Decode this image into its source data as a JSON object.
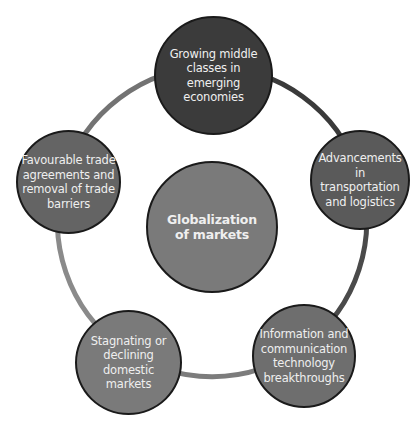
{
  "diagram": {
    "type": "cycle",
    "center": {
      "label": "Globalization of markets",
      "lines": [
        "Globalization",
        "of markets"
      ],
      "color": "#7a7a7a"
    },
    "nodes": [
      {
        "id": "growing-middle-classes",
        "lines": [
          "Growing middle",
          "classes in",
          "emerging",
          "economies"
        ],
        "label": "Growing middle classes in emerging economies",
        "color": "#3b3b3b"
      },
      {
        "id": "advancements-transportation",
        "lines": [
          "Advancements in",
          "transportation",
          "and logistics"
        ],
        "label": "Advancements in transportation and logistics",
        "color": "#5a5a5a"
      },
      {
        "id": "ict-breakthroughs",
        "lines": [
          "Information and",
          "communication",
          "technology",
          "breakthroughs"
        ],
        "label": "Information and communication technology breakthroughs",
        "color": "#6e6e6e"
      },
      {
        "id": "stagnating-domestic",
        "lines": [
          "Stagnating or",
          "declining",
          "domestic",
          "markets"
        ],
        "label": "Stagnating or declining domestic markets",
        "color": "#7a7a7a"
      },
      {
        "id": "favourable-trade",
        "lines": [
          "Favourable trade",
          "agreements and",
          "removal of trade",
          "barriers"
        ],
        "label": "Favourable trade agreements and removal of trade barriers",
        "color": "#646464"
      }
    ],
    "ring_segments": [
      {
        "from": "growing-middle-classes",
        "to": "advancements-transportation",
        "color": "#3a3a3a"
      },
      {
        "from": "advancements-transportation",
        "to": "ict-breakthroughs",
        "color": "#4a4a4a"
      },
      {
        "from": "ict-breakthroughs",
        "to": "stagnating-domestic",
        "color": "#7c7c7c"
      },
      {
        "from": "stagnating-domestic",
        "to": "favourable-trade",
        "color": "#8a8a8a"
      },
      {
        "from": "favourable-trade",
        "to": "growing-middle-classes",
        "color": "#737373"
      }
    ]
  }
}
